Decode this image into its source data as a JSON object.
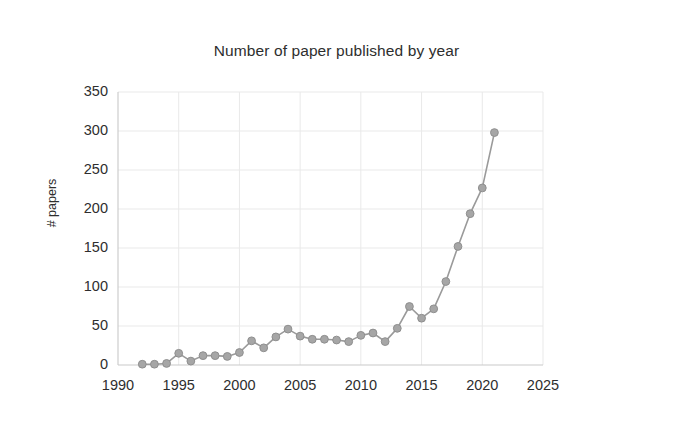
{
  "chart_data": {
    "type": "line",
    "title": "Number of paper published by year",
    "xlabel": "",
    "ylabel": "# papers",
    "xlim": [
      1990,
      2025
    ],
    "ylim": [
      0,
      350
    ],
    "xticks": [
      1990,
      1995,
      2000,
      2005,
      2010,
      2015,
      2020,
      2025
    ],
    "yticks": [
      0,
      50,
      100,
      150,
      200,
      250,
      300,
      350
    ],
    "grid": true,
    "legend": null,
    "series": [
      {
        "name": "# papers",
        "color": "#9a9a9a",
        "marker": "circle",
        "x": [
          1992,
          1993,
          1994,
          1995,
          1996,
          1997,
          1998,
          1999,
          2000,
          2001,
          2002,
          2003,
          2004,
          2005,
          2006,
          2007,
          2008,
          2009,
          2010,
          2011,
          2012,
          2013,
          2014,
          2015,
          2016,
          2017,
          2018,
          2019,
          2020,
          2021
        ],
        "values": [
          1,
          1,
          2,
          15,
          5,
          12,
          12,
          11,
          16,
          31,
          22,
          36,
          46,
          37,
          33,
          33,
          32,
          30,
          38,
          41,
          30,
          47,
          75,
          60,
          72,
          107,
          152,
          194,
          227,
          298
        ]
      }
    ]
  },
  "axes": {
    "y_tick_labels": [
      "350",
      "300",
      "250",
      "200",
      "150",
      "100",
      "50",
      "0"
    ],
    "x_tick_labels": [
      "1990",
      "1995",
      "2000",
      "2005",
      "2010",
      "2015",
      "2020",
      "2025"
    ],
    "y_axis_title": "# papers"
  },
  "style": {
    "line_color": "#9a9a9a",
    "marker_color": "#a6a6a6",
    "marker_edge_color": "#8f8f8f",
    "grid_color": "#e9e9e9",
    "axis_color": "#c9c9c9",
    "background": "#ffffff",
    "text_color": "#2e2e2e"
  }
}
